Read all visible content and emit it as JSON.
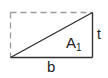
{
  "diagram": {
    "type": "right-triangle-in-rectangle",
    "shape_label": "A",
    "shape_label_subscript": "1",
    "base_label": "b",
    "height_label": "t",
    "colors": {
      "solid_line": "#333333",
      "dashed_line": "#9a9a9a",
      "text": "#222222",
      "background": "#ffffff"
    }
  }
}
